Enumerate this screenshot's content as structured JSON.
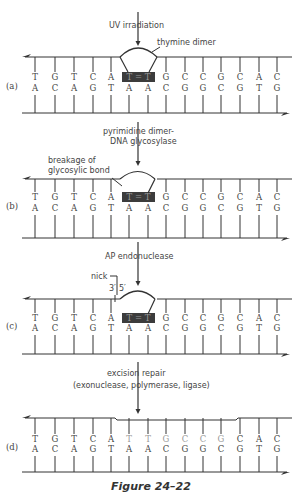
{
  "figure": {
    "caption": "Figure 24–22",
    "columns_x": [
      35,
      55,
      74,
      93,
      111,
      129,
      148,
      166,
      185,
      203,
      221,
      240,
      259,
      277
    ],
    "top_strand": [
      "T",
      "G",
      "T",
      "C",
      "A",
      "T",
      "T",
      "G",
      "C",
      "C",
      "G",
      "C",
      "A",
      "C"
    ],
    "bottom_strand": [
      "A",
      "C",
      "A",
      "G",
      "T",
      "A",
      "A",
      "C",
      "G",
      "G",
      "C",
      "G",
      "T",
      "G"
    ],
    "dimer_label": "T = T",
    "panels": [
      {
        "id": "a",
        "label": "(a)",
        "step_label": [
          "UV irradiation"
        ],
        "annotation": "thymine dimer"
      },
      {
        "id": "b",
        "label": "(b)",
        "step_label": [
          "pyrimidine dimer-",
          "DNA glycosylase"
        ],
        "annotation": [
          "breakage of",
          "glycosylic bond"
        ]
      },
      {
        "id": "c",
        "label": "(c)",
        "step_label": [
          "AP endonuclease"
        ],
        "annotation": "nick",
        "end_labels": [
          "3′",
          "5′"
        ]
      },
      {
        "id": "d",
        "label": "(d)",
        "step_label": [
          "excision repair",
          "(exonuclease, polymerase, ligase)"
        ],
        "new_bases_top": [
          "T",
          "T",
          "G",
          "C",
          "C",
          "G"
        ]
      }
    ]
  },
  "colors": {
    "line": "#333333",
    "dimer_box": "#3c3c3c",
    "new_base": "#9a9a9a"
  }
}
